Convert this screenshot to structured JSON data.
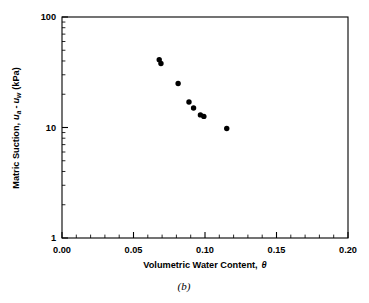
{
  "figure": {
    "caption": "(b)",
    "background_color": "#ffffff",
    "marker_color": "#000000",
    "axis_color": "#000000"
  },
  "chart_data": {
    "type": "scatter",
    "title": "",
    "xlabel_parts": {
      "text": "Volumetric Water Content,",
      "symbol": "θ"
    },
    "ylabel_parts": {
      "lead": "Matric Suction,",
      "var1": "u",
      "sub1": "a",
      "minus": "-",
      "var2": "u",
      "sub2": "w",
      "units": "(kPa)"
    },
    "xlabel": "Volumetric Water Content, θ",
    "ylabel": "Matric Suction, ua - uw (kPa)",
    "xscale": "linear",
    "yscale": "log",
    "xlim": [
      0.0,
      0.2
    ],
    "ylim": [
      1,
      100
    ],
    "xticks": [
      0.0,
      0.05,
      0.1,
      0.15,
      0.2
    ],
    "xticklabels": [
      "0.00",
      "0.05",
      "0.10",
      "0.15",
      "0.20"
    ],
    "x_minor_step": 0.01,
    "yticks": [
      1,
      10,
      100
    ],
    "yticklabels": [
      "1",
      "10",
      "100"
    ],
    "grid": false,
    "legend": null,
    "marker": "filled-circle",
    "points": [
      {
        "x": 0.068,
        "y": 41.0
      },
      {
        "x": 0.0692,
        "y": 38.0
      },
      {
        "x": 0.0812,
        "y": 25.0
      },
      {
        "x": 0.0888,
        "y": 17.0
      },
      {
        "x": 0.092,
        "y": 15.0
      },
      {
        "x": 0.0968,
        "y": 13.0
      },
      {
        "x": 0.0992,
        "y": 12.6
      },
      {
        "x": 0.1152,
        "y": 9.8
      }
    ]
  }
}
